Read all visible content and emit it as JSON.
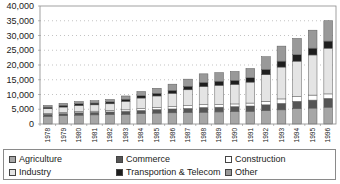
{
  "chart_data": {
    "type": "bar",
    "stacked": true,
    "title": "",
    "xlabel": "",
    "ylabel": "",
    "ylim": [
      0,
      40000
    ],
    "yticks": [
      0,
      5000,
      10000,
      15000,
      20000,
      25000,
      30000,
      35000,
      40000
    ],
    "ytick_labels": [
      "0",
      "5,000",
      "10,000",
      "15,000",
      "20,000",
      "25,000",
      "30,000",
      "35,000",
      "40,000"
    ],
    "grid": "horizontal dotted",
    "legend_position": "bottom",
    "categories": [
      "1978",
      "1979",
      "1980",
      "1981",
      "1982",
      "1983",
      "1984",
      "1985",
      "1986",
      "1987",
      "1988",
      "1989",
      "1990",
      "1991",
      "1992",
      "1993",
      "1994",
      "1995",
      "1996"
    ],
    "series": [
      {
        "name": "Agriculture",
        "color": "#a6a6a6",
        "values": [
          2600,
          2800,
          3000,
          3100,
          3200,
          3300,
          3500,
          3700,
          3800,
          3900,
          4000,
          4100,
          4200,
          4300,
          4500,
          4800,
          5200,
          5400,
          5700
        ]
      },
      {
        "name": "Commerce",
        "color": "#555555",
        "values": [
          700,
          750,
          800,
          850,
          900,
          1000,
          1100,
          1200,
          1300,
          1400,
          1600,
          1600,
          1700,
          1800,
          2000,
          2200,
          2500,
          2700,
          3000
        ]
      },
      {
        "name": "Construction",
        "color": "#ffffff",
        "values": [
          300,
          350,
          400,
          400,
          450,
          500,
          600,
          700,
          800,
          900,
          1000,
          900,
          900,
          1000,
          1200,
          1500,
          1600,
          1700,
          1500
        ]
      },
      {
        "name": "Industry",
        "color": "#e4e4e4",
        "values": [
          1600,
          1850,
          2050,
          2150,
          2300,
          2900,
          3600,
          3900,
          4500,
          5400,
          6100,
          6500,
          6600,
          7100,
          9000,
          10800,
          12000,
          13600,
          15500
        ]
      },
      {
        "name": "Transportion & Telecom",
        "color": "#1e1e1e",
        "values": [
          500,
          550,
          600,
          600,
          650,
          700,
          800,
          900,
          1000,
          1200,
          1400,
          1400,
          1400,
          1500,
          1800,
          2000,
          2200,
          2300,
          2400
        ]
      },
      {
        "name": "Other",
        "color": "#999999",
        "values": [
          600,
          700,
          750,
          800,
          800,
          1100,
          1400,
          1700,
          2100,
          2400,
          2900,
          2900,
          3000,
          3100,
          4300,
          5100,
          5500,
          6100,
          6900
        ]
      }
    ]
  },
  "legend": {
    "items": [
      {
        "label": "Agriculture",
        "color": "#a6a6a6"
      },
      {
        "label": "Commerce",
        "color": "#555555"
      },
      {
        "label": "Construction",
        "color": "#ffffff"
      },
      {
        "label": "Industry",
        "color": "#e4e4e4"
      },
      {
        "label": "Transportion & Telecom",
        "color": "#1e1e1e"
      },
      {
        "label": "Other",
        "color": "#999999"
      }
    ]
  }
}
